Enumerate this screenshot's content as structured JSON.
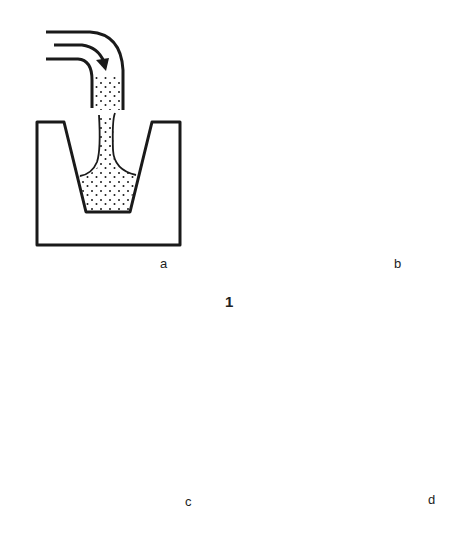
{
  "figure": {
    "number": "1",
    "panels": [
      {
        "id": "a",
        "label": "a",
        "description": "Slip poured from a curved spout into a tapered mould cavity"
      },
      {
        "id": "b",
        "label": "b",
        "description": "Mould filled with slip; arrows show water absorbed outward into mould walls"
      },
      {
        "id": "c",
        "label": "c",
        "description": "Mould tilted to drain excess slip, leaving a coated layer"
      },
      {
        "id": "d",
        "label": "d",
        "description": "Upright mould with thin cast layer lining the cavity"
      }
    ]
  },
  "colors": {
    "ink": "#1a1a1a",
    "background": "#ffffff"
  }
}
